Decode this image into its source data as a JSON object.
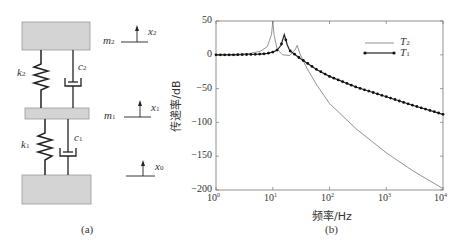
{
  "panel_a": {
    "caption": "(a)",
    "labels": {
      "m2": "m",
      "m2_sub": "2",
      "m1": "m",
      "m1_sub": "1",
      "k2": "k",
      "k2_sub": "2",
      "k1": "k",
      "k1_sub": "1",
      "c2": "c",
      "c2_sub": "2",
      "c1": "c",
      "c1_sub": "1",
      "x2": "x",
      "x2_sub": "2",
      "x1": "x",
      "x1_sub": "1",
      "x0": "x",
      "x0_sub": "0"
    },
    "colors": {
      "mass_fill": "#d4d4d4",
      "mass_stroke": "#888888",
      "line": "#222222"
    }
  },
  "panel_b": {
    "caption": "(b)",
    "ylabel": "传递率/dB",
    "xlabel": "频率/Hz",
    "yticks": [
      "50",
      "0",
      "−50",
      "−100",
      "−150",
      "−200"
    ],
    "xticks": [
      {
        "base": "10",
        "exp": "0"
      },
      {
        "base": "10",
        "exp": "1"
      },
      {
        "base": "10",
        "exp": "2"
      },
      {
        "base": "10",
        "exp": "3"
      },
      {
        "base": "10",
        "exp": "4"
      }
    ],
    "legend": [
      {
        "name": "T",
        "sub": "2",
        "style": "line"
      },
      {
        "name": "T",
        "sub": "1",
        "style": "line-dots"
      }
    ]
  },
  "chart_data": {
    "type": "line",
    "title": "",
    "xlabel": "频率/Hz",
    "ylabel": "传递率/dB",
    "xscale": "log",
    "xlim": [
      1,
      10000
    ],
    "ylim": [
      -200,
      50
    ],
    "grid": false,
    "legend_position": "upper right",
    "series": [
      {
        "name": "T2",
        "marker": "none",
        "x": [
          1,
          2,
          4,
          6,
          8,
          9.5,
          10,
          10.5,
          12,
          15,
          20,
          25,
          27,
          30,
          40,
          60,
          100,
          300,
          1000,
          3000,
          10000
        ],
        "y": [
          0,
          0.5,
          2,
          5,
          12,
          30,
          50,
          30,
          8,
          0,
          -1,
          8,
          14,
          2,
          -20,
          -45,
          -72,
          -110,
          -145,
          -172,
          -198
        ]
      },
      {
        "name": "T1",
        "marker": "dot",
        "x": [
          1,
          2,
          4,
          6,
          8,
          10,
          12,
          14,
          16,
          18,
          20,
          25,
          30,
          40,
          60,
          100,
          300,
          1000,
          3000,
          10000
        ],
        "y": [
          0,
          0,
          0.5,
          1,
          2,
          4,
          7,
          14,
          30,
          15,
          6,
          0,
          -5,
          -12,
          -22,
          -32,
          -48,
          -62,
          -75,
          -88
        ]
      }
    ]
  }
}
